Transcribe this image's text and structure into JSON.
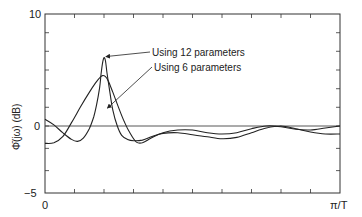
{
  "chart_data": {
    "type": "line",
    "title": "",
    "xlabel": "",
    "ylabel": "Φ̄(jω) (dB)",
    "x_tick_labels": [
      "0",
      "π/T"
    ],
    "y_tick_labels": [
      "10",
      "0",
      "−5"
    ],
    "xlim": [
      0,
      1
    ],
    "ylim": [
      -5,
      10
    ],
    "x_unit_note": "x is fraction of π/T",
    "grid": false,
    "zero_line": true,
    "minor_ticks_x": 10,
    "minor_ticks_y_per_5dB": 3,
    "annotations": [
      {
        "text": "Using 12 parameters",
        "target_series": "Using 12 parameters",
        "arrow_to": [
          0.2,
          6.2
        ]
      },
      {
        "text": "Using 6 parameters",
        "target_series": "Using 6 parameters",
        "arrow_to": [
          0.205,
          1.6
        ]
      }
    ],
    "series": [
      {
        "name": "Using 12 parameters",
        "x": [
          0.0,
          0.03,
          0.06,
          0.09,
          0.11,
          0.13,
          0.15,
          0.165,
          0.175,
          0.185,
          0.19,
          0.195,
          0.2,
          0.205,
          0.21,
          0.22,
          0.23,
          0.245,
          0.26,
          0.28,
          0.3,
          0.33,
          0.36,
          0.4,
          0.45,
          0.5,
          0.55,
          0.6,
          0.65,
          0.7,
          0.75,
          0.8,
          0.85,
          0.9,
          0.95,
          1.0
        ],
        "y": [
          0.6,
          0.1,
          -0.5,
          -1.0,
          -1.15,
          -0.9,
          -0.2,
          0.8,
          1.9,
          3.4,
          4.6,
          5.6,
          6.1,
          5.8,
          4.8,
          3.0,
          1.4,
          0.0,
          -0.7,
          -1.0,
          -1.1,
          -1.05,
          -0.8,
          -0.55,
          -0.5,
          -0.65,
          -0.8,
          -0.95,
          -0.85,
          -0.5,
          -0.15,
          0.0,
          -0.2,
          -0.45,
          -0.6,
          -0.6
        ]
      },
      {
        "name": "Using 6 parameters",
        "x": [
          0.0,
          0.03,
          0.06,
          0.09,
          0.12,
          0.15,
          0.17,
          0.185,
          0.195,
          0.205,
          0.215,
          0.23,
          0.25,
          0.27,
          0.29,
          0.31,
          0.33,
          0.36,
          0.4,
          0.45,
          0.5,
          0.55,
          0.6,
          0.65,
          0.7,
          0.75,
          0.8,
          0.85,
          0.9,
          0.95,
          1.0
        ],
        "y": [
          -1.3,
          -1.25,
          -0.8,
          0.3,
          1.7,
          3.0,
          3.8,
          4.3,
          4.5,
          4.4,
          4.0,
          3.0,
          1.6,
          0.3,
          -0.6,
          -1.2,
          -1.25,
          -0.9,
          -0.5,
          -0.3,
          -0.3,
          -0.5,
          -0.6,
          -0.5,
          -0.2,
          0.0,
          -0.05,
          -0.25,
          -0.3,
          -0.15,
          0.0
        ]
      }
    ]
  },
  "labels": {
    "y_top": "10",
    "y_zero": "0",
    "y_bottom": "−5",
    "x_left": "0",
    "x_right": "π/T",
    "y_axis": "Φ̄(jω) (dB)",
    "legend_12": "Using 12 parameters",
    "legend_6": "Using 6 parameters"
  }
}
